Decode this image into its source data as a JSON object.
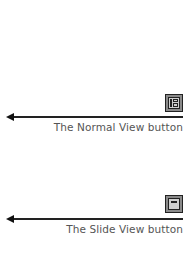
{
  "callouts": [
    {
      "label": "The Normal View button",
      "icon": "normal-view-icon"
    },
    {
      "label": "The Slide View button",
      "icon": "slide-view-icon"
    }
  ],
  "colors": {
    "arrow": "#222222",
    "label_text": "#555555",
    "icon_frame": "#8a8a8a",
    "icon_inner": "#cfcfcf"
  }
}
